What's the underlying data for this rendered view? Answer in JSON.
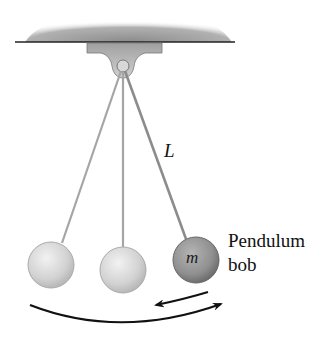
{
  "diagram": {
    "labels": {
      "length": "L",
      "mass": "m",
      "bob_line1": "Pendulum",
      "bob_line2": "bob"
    },
    "colors": {
      "ceiling": "#8a8a8a",
      "bracket": "#b5b5b5",
      "string": "#a9a9a9",
      "bob_light": "#d6d6d6",
      "bob_dark": "#8e8e8e",
      "arrow": "#111111"
    },
    "elements": [
      {
        "id": "ceiling",
        "type": "support"
      },
      {
        "id": "pivot",
        "type": "pivot",
        "x": 123,
        "y": 66
      },
      {
        "id": "bob-left",
        "x": 51,
        "y": 265,
        "shade": "light"
      },
      {
        "id": "bob-center",
        "x": 123,
        "y": 270,
        "shade": "light"
      },
      {
        "id": "bob-right",
        "x": 196,
        "y": 260,
        "shade": "dark",
        "label": "m"
      },
      {
        "id": "swing-arc",
        "type": "arrow",
        "direction": "right"
      },
      {
        "id": "return-arrow",
        "type": "arrow",
        "direction": "left"
      }
    ]
  }
}
